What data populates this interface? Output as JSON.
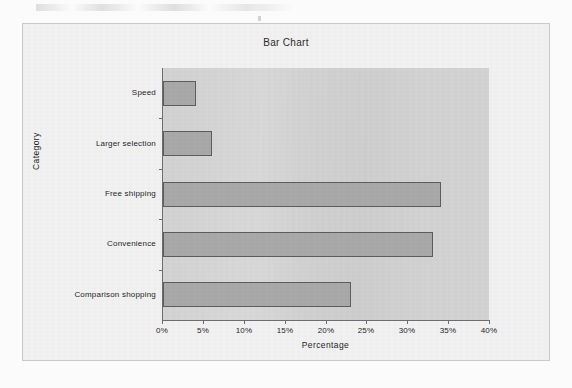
{
  "chart_data": {
    "type": "bar",
    "orientation": "horizontal",
    "title": "Bar Chart",
    "xlabel": "Percentage",
    "ylabel": "Category",
    "categories": [
      "Comparison shopping",
      "Convenience",
      "Free shipping",
      "Larger selection",
      "Speed"
    ],
    "values": [
      23,
      33,
      34,
      6,
      4
    ],
    "value_suffix": "%",
    "xlim": [
      0,
      40
    ],
    "xticks": [
      0,
      5,
      10,
      15,
      20,
      25,
      30,
      35,
      40
    ],
    "xtick_labels": [
      "0%",
      "5%",
      "10%",
      "15%",
      "20%",
      "25%",
      "30%",
      "35%",
      "40%"
    ],
    "grid": false,
    "legend": false,
    "series": [
      {
        "name": "Percentage",
        "values": [
          23,
          33,
          34,
          6,
          4
        ]
      }
    ],
    "colors": {
      "bar_fill": "#a9a9a9",
      "bar_border": "#5d5d5d",
      "plot_background": "#d3d3d3",
      "frame_background": "#f2f2f2",
      "frame_border": "#c9c9c9",
      "axis": "#6e6e6e",
      "text": "#1f1f1f"
    }
  },
  "bars": [
    {
      "label": "Speed",
      "value": 4
    },
    {
      "label": "Larger selection",
      "value": 6
    },
    {
      "label": "Free shipping",
      "value": 34
    },
    {
      "label": "Convenience",
      "value": 33
    },
    {
      "label": "Comparison shopping",
      "value": 23
    }
  ],
  "xticks": [
    {
      "label": "0%",
      "value": 0
    },
    {
      "label": "5%",
      "value": 5
    },
    {
      "label": "10%",
      "value": 10
    },
    {
      "label": "15%",
      "value": 15
    },
    {
      "label": "20%",
      "value": 20
    },
    {
      "label": "25%",
      "value": 25
    },
    {
      "label": "30%",
      "value": 30
    },
    {
      "label": "35%",
      "value": 35
    },
    {
      "label": "40%",
      "value": 40
    }
  ]
}
